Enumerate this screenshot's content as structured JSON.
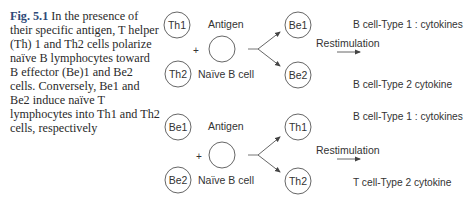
{
  "caption": {
    "fig_label": "Fig. 5.1",
    "text": "In the presence of their specific antigen, T helper (Th) 1 and Th2 cells polarize naïve B lymphocytes toward B effector (Be)1 and Be2 cells. Conversely, Be1 and Be2 induce naïve T lymphocytes into Th1 and Th2 cells, respectively"
  },
  "diagram": {
    "top_panel": {
      "inducer_top": "Th1",
      "inducer_bottom": "Th2",
      "antigen_label": "Antigen",
      "plus": "+",
      "naive_label": "Naïve B cell",
      "effector_top": "Be1",
      "effector_bottom": "Be2",
      "restimulation_label": "Restimulation",
      "output_top": "B cell-Type 1 : cytokines",
      "output_bottom": "B cell-Type 2 cytokine"
    },
    "bottom_panel": {
      "inducer_top": "Be1",
      "inducer_bottom": "Be2",
      "antigen_label": "Antigen",
      "plus": "+",
      "naive_label": "Naïve B cell",
      "effector_top": "Th1",
      "effector_bottom": "Th2",
      "restimulation_label": "Restimulation",
      "output_top": "B cell-Type 1 : cytokines",
      "output_bottom": "T cell-Type 2 cytokine"
    },
    "colors": {
      "line": "#555555",
      "text": "#333333",
      "fig_label": "#2e4a78"
    }
  }
}
